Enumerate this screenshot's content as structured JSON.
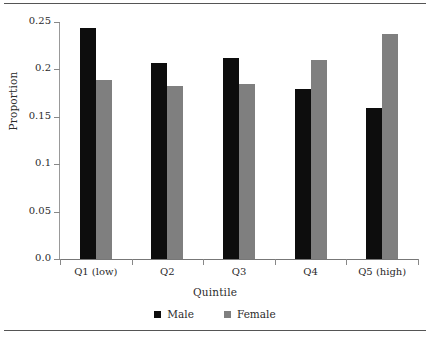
{
  "chart_data": {
    "type": "bar",
    "title": "",
    "xlabel": "Quintile",
    "ylabel": "Proportion",
    "categories": [
      "Q1 (low)",
      "Q2",
      "Q3",
      "Q4",
      "Q5 (high)"
    ],
    "series": [
      {
        "name": "Male",
        "color": "#0d0d0d",
        "values": [
          0.244,
          0.207,
          0.212,
          0.179,
          0.159
        ]
      },
      {
        "name": "Female",
        "color": "#7f7f7f",
        "values": [
          0.189,
          0.183,
          0.185,
          0.21,
          0.237
        ]
      }
    ],
    "ylim": [
      0.0,
      0.25
    ],
    "yticks": [
      0.0,
      0.05,
      0.1,
      0.15,
      0.2,
      0.25
    ],
    "ytick_labels": [
      "0.0",
      "0.05",
      "0.1",
      "0.15",
      "0.2",
      "0.25"
    ],
    "grid": false,
    "legend_position": "bottom"
  },
  "legend": {
    "items": [
      {
        "label": "Male",
        "color": "#0d0d0d"
      },
      {
        "label": "Female",
        "color": "#7f7f7f"
      }
    ]
  },
  "axes": {
    "x_title": "Quintile",
    "y_title": "Proportion"
  }
}
